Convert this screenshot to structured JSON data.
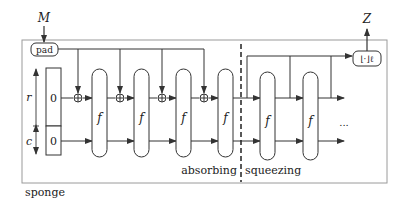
{
  "diagram": {
    "title": "sponge",
    "input_label": "M",
    "output_label": "Z",
    "pad_label": "pad",
    "truncate_label": "⌊·⌋ℓ",
    "rate_label": "r",
    "capacity_label": "c",
    "rate_init": "0",
    "capacity_init": "0",
    "function_label": "f",
    "phase_absorbing": "absorbing",
    "phase_squeezing": "squeezing",
    "ellipsis": "...",
    "absorb_rounds": 4,
    "squeeze_rounds": 2
  },
  "colors": {
    "line": "#333333",
    "frame": "#9a9a9a",
    "text": "#222222"
  }
}
